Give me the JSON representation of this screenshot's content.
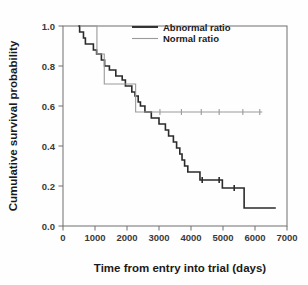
{
  "chart_data": {
    "type": "line",
    "subtype": "kaplan-meier-step",
    "title": "",
    "xlabel": "Time from entry into trial (days)",
    "ylabel": "Cumulative survival probability",
    "xlim": [
      0,
      7000
    ],
    "ylim": [
      0.0,
      1.0
    ],
    "xticks": [
      0,
      1000,
      2000,
      3000,
      4000,
      5000,
      6000,
      7000
    ],
    "xtick_labels": [
      "0",
      "1000",
      "2000",
      "3000",
      "4000",
      "5000",
      "6000",
      "7000"
    ],
    "yticks": [
      0.0,
      0.2,
      0.4,
      0.6,
      0.8,
      1.0
    ],
    "ytick_labels": [
      "0.0",
      "0.2",
      "0.4",
      "0.6",
      "0.8",
      "1.0"
    ],
    "grid": false,
    "legend_position": "top-center",
    "frame": "box",
    "series": [
      {
        "name": "Abnormal ratio",
        "color": "#2b2b2b",
        "line_width": 1.6,
        "points": [
          [
            480,
            1.0
          ],
          [
            520,
            0.97
          ],
          [
            640,
            0.94
          ],
          [
            700,
            0.91
          ],
          [
            900,
            0.91
          ],
          [
            950,
            0.88
          ],
          [
            1050,
            0.86
          ],
          [
            1150,
            0.86
          ],
          [
            1200,
            0.83
          ],
          [
            1300,
            0.8
          ],
          [
            1400,
            0.8
          ],
          [
            1450,
            0.78
          ],
          [
            1600,
            0.78
          ],
          [
            1650,
            0.75
          ],
          [
            1800,
            0.75
          ],
          [
            1850,
            0.73
          ],
          [
            1950,
            0.7
          ],
          [
            2100,
            0.7
          ],
          [
            2150,
            0.67
          ],
          [
            2250,
            0.65
          ],
          [
            2350,
            0.62
          ],
          [
            2420,
            0.6
          ],
          [
            2500,
            0.6
          ],
          [
            2560,
            0.57
          ],
          [
            2700,
            0.57
          ],
          [
            2760,
            0.54
          ],
          [
            2950,
            0.54
          ],
          [
            3000,
            0.51
          ],
          [
            3150,
            0.51
          ],
          [
            3200,
            0.48
          ],
          [
            3300,
            0.45
          ],
          [
            3450,
            0.42
          ],
          [
            3550,
            0.39
          ],
          [
            3650,
            0.36
          ],
          [
            3720,
            0.33
          ],
          [
            3800,
            0.3
          ],
          [
            3900,
            0.27
          ],
          [
            4200,
            0.27
          ],
          [
            4280,
            0.23
          ],
          [
            4900,
            0.23
          ],
          [
            4980,
            0.19
          ],
          [
            5600,
            0.19
          ],
          [
            5660,
            0.09
          ],
          [
            6650,
            0.09
          ]
        ],
        "censor_marks": [
          [
            4880,
            0.23
          ],
          [
            4350,
            0.23
          ],
          [
            5350,
            0.19
          ]
        ]
      },
      {
        "name": "Normal ratio",
        "color": "#9a9a9a",
        "line_width": 1.1,
        "points": [
          [
            530,
            1.0
          ],
          [
            1020,
            1.0
          ],
          [
            1060,
            0.86
          ],
          [
            1250,
            0.86
          ],
          [
            1290,
            0.71
          ],
          [
            2220,
            0.71
          ],
          [
            2270,
            0.57
          ],
          [
            6230,
            0.57
          ]
        ],
        "censor_marks": [
          [
            3030,
            0.57
          ],
          [
            3700,
            0.57
          ],
          [
            4320,
            0.57
          ],
          [
            4880,
            0.57
          ],
          [
            5620,
            0.57
          ],
          [
            6150,
            0.57
          ]
        ]
      }
    ],
    "legend": [
      {
        "label": "Abnormal ratio",
        "color": "#2b2b2b",
        "line_width": 1.9
      },
      {
        "label": "Normal ratio",
        "color": "#9a9a9a",
        "line_width": 1.1
      }
    ]
  },
  "colors": {
    "abnormal": "#2b2b2b",
    "normal": "#9a9a9a",
    "axis": "#6e6e6e",
    "text": "#1a1a1a",
    "background": "#fefefe"
  }
}
